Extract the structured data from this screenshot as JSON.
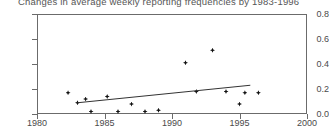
{
  "chart_data": {
    "type": "scatter",
    "title": "Changes in average weekly reporting frequencies by 1983-1996",
    "xlabel": "",
    "ylabel": "",
    "xlim": [
      1980,
      2000
    ],
    "ylim": [
      0.0,
      0.8
    ],
    "xticks": [
      1980,
      1985,
      1990,
      1995,
      2000
    ],
    "xtick_labels": [
      "1980",
      "1985",
      "1990",
      "1995",
      "2000"
    ],
    "yticks": [
      0.0,
      0.2,
      0.4,
      0.6,
      0.8
    ],
    "ytick_labels": [
      "0.0",
      "0.2",
      "0.4",
      "0.6",
      "0.8"
    ],
    "grid": false,
    "legend": null,
    "marker": "diamond",
    "marker_color": "#111111",
    "axis_color": "#6b6b6b",
    "points": [
      {
        "x": 1982.3,
        "y": 0.17
      },
      {
        "x": 1983.0,
        "y": 0.09
      },
      {
        "x": 1983.6,
        "y": 0.12
      },
      {
        "x": 1984.0,
        "y": 0.02
      },
      {
        "x": 1985.2,
        "y": 0.14
      },
      {
        "x": 1986.0,
        "y": 0.02
      },
      {
        "x": 1987.0,
        "y": 0.08
      },
      {
        "x": 1988.0,
        "y": 0.02
      },
      {
        "x": 1989.0,
        "y": 0.03
      },
      {
        "x": 1991.0,
        "y": 0.41
      },
      {
        "x": 1991.8,
        "y": 0.18
      },
      {
        "x": 1993.0,
        "y": 0.51
      },
      {
        "x": 1994.0,
        "y": 0.18
      },
      {
        "x": 1995.0,
        "y": 0.08
      },
      {
        "x": 1995.4,
        "y": 0.17
      },
      {
        "x": 1996.4,
        "y": 0.17
      }
    ],
    "trendline": {
      "x0": 1983.0,
      "y0": 0.09,
      "x1": 1995.8,
      "y1": 0.23
    }
  }
}
